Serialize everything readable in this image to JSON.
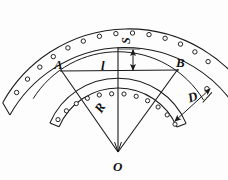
{
  "figure": {
    "kind": "technical-geometry-diagram",
    "background_color": "#fdfdfd",
    "line_color": "#1a1a1a",
    "labels": {
      "point_a": "A",
      "point_b": "B",
      "center_o": "O",
      "radius": "R",
      "chord": "l",
      "sagitta": "S",
      "hole_distance": "D"
    },
    "geometry": {
      "center": {
        "x": 118,
        "y": 152
      },
      "outer_band": {
        "radius_outer": 144,
        "radius_inner": 132,
        "start_angle_deg": 200,
        "end_angle_deg": 338,
        "hole_count": 16,
        "hole_radius": 2.2
      },
      "inner_band": {
        "radius_outer": 74,
        "radius_inner": 64,
        "start_angle_deg": 203,
        "end_angle_deg": 337,
        "hole_count": 14,
        "hole_radius": 2.1
      },
      "sagitta_arc": {
        "radius": 100,
        "start_angle_deg": 212,
        "end_angle_deg": 328
      },
      "chord_line": {
        "x1": 62,
        "y1": 71,
        "x2": 177,
        "y2": 70
      },
      "radius_lines": [
        {
          "x1": 118,
          "y1": 152,
          "x2": 62,
          "y2": 71
        },
        {
          "x1": 118,
          "y1": 152,
          "x2": 177,
          "y2": 70
        },
        {
          "x1": 118,
          "y1": 152,
          "x2": 118,
          "y2": 48
        }
      ],
      "sagitta_dimension": {
        "x": 133,
        "y_top": 48,
        "y_bottom": 72
      },
      "distance_dimension": {
        "x1": 176,
        "y1": 120,
        "x2": 210,
        "y2": 89
      }
    }
  }
}
